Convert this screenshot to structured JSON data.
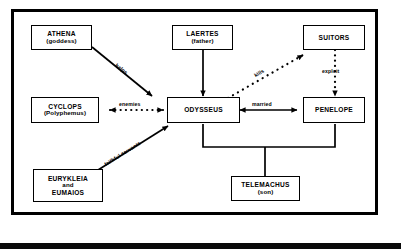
{
  "diagram": {
    "frame_color": "#000000",
    "background_color": "#ffffff",
    "nodes": [
      {
        "id": "athena",
        "line1": "ATHENA",
        "line2": "(goddess)"
      },
      {
        "id": "laertes",
        "line1": "LAERTES",
        "line2": "(father)"
      },
      {
        "id": "suitors",
        "line1": "SUITORS",
        "line2": ""
      },
      {
        "id": "cyclops",
        "line1": "CYCLOPS",
        "line2": "(Polyphemus)"
      },
      {
        "id": "odysseus",
        "line1": "ODYSSEUS",
        "line2": ""
      },
      {
        "id": "penelope",
        "line1": "PENELOPE",
        "line2": ""
      },
      {
        "id": "eurykleia",
        "line1": "EURYKLEIA",
        "line2": "and",
        "line3": "EUMAIOS"
      },
      {
        "id": "telemachus",
        "line1": "TELEMACHUS",
        "line2": "(son)"
      }
    ],
    "edges": [
      {
        "id": "helps",
        "label": "helps",
        "from": "athena",
        "to": "odysseus",
        "style": "solid",
        "arrow": "single"
      },
      {
        "id": "father-line",
        "label": "",
        "from": "laertes",
        "to": "odysseus",
        "style": "solid",
        "arrow": "single"
      },
      {
        "id": "enemies",
        "label": "enemies",
        "from": "cyclops",
        "to": "odysseus",
        "style": "dotted",
        "arrow": "double"
      },
      {
        "id": "kills",
        "label": "kills",
        "from": "odysseus",
        "to": "suitors",
        "style": "dotted",
        "arrow": "single"
      },
      {
        "id": "exploit",
        "label": "exploit",
        "from": "suitors",
        "to": "penelope",
        "style": "dotted",
        "arrow": "single"
      },
      {
        "id": "married",
        "label": "married",
        "from": "odysseus",
        "to": "penelope",
        "style": "solid",
        "arrow": "double"
      },
      {
        "id": "faithful-servants",
        "label": "faithful servants",
        "from": "eurykleia",
        "to": "odysseus",
        "style": "solid",
        "arrow": "single"
      },
      {
        "id": "child-bracket",
        "label": "",
        "from": "odysseus+penelope",
        "to": "telemachus",
        "style": "solid",
        "arrow": "none"
      }
    ]
  }
}
